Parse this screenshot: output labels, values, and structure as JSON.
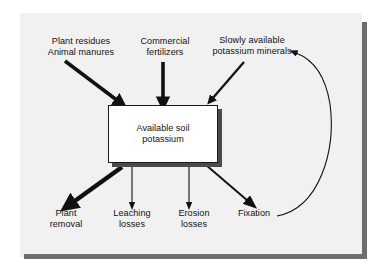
{
  "figure": {
    "type": "flow-diagram",
    "background_color": "#f1f1f1",
    "shadow_color": "#6d6d6d",
    "stroke_color": "#111111",
    "box_fill_color": "#ffffff"
  },
  "central_box": {
    "name": "available-soil-potassium",
    "line1": "Available soil",
    "line2": "potassium"
  },
  "inputs": [
    {
      "name": "plant-residues-animal-manures",
      "line1": "Plant residues",
      "line2": "Animal manures",
      "arrow": "thick-diagonal-down-right"
    },
    {
      "name": "commercial-fertilizers",
      "line1": "Commercial",
      "line2": "fertilizers",
      "arrow": "thick-vertical-down"
    },
    {
      "name": "slowly-available-potassium-minerals",
      "line1": "Slowly available",
      "line2": "potassium minerals",
      "arrow": "medium-diagonal-down-left"
    }
  ],
  "outputs": [
    {
      "name": "plant-removal",
      "line1": "Plant",
      "line2": "removal",
      "arrow": "very-thick-diagonal-down-left"
    },
    {
      "name": "leaching-losses",
      "line1": "Leaching",
      "line2": "losses",
      "arrow": "thin-vertical-down"
    },
    {
      "name": "erosion-losses",
      "line1": "Erosion",
      "line2": "losses",
      "arrow": "thin-vertical-down"
    },
    {
      "name": "fixation",
      "line1": "Fixation",
      "line2": "",
      "arrow": "medium-diagonal-down-right"
    }
  ],
  "feedback_arrow": {
    "name": "fixation-to-minerals-curve",
    "from": "Fixation",
    "to": "Slowly available potassium minerals",
    "style": "thin-curved-arc"
  }
}
